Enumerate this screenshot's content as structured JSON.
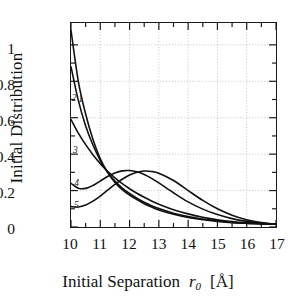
{
  "chart_data": {
    "type": "line",
    "title": "",
    "xlabel": "Initial Separation  r0  [Å]",
    "ylabel": "Initial Distribution",
    "xlim": [
      10,
      17
    ],
    "ylim": [
      0,
      1.12
    ],
    "grid": true,
    "legend": "inline-curve-labels",
    "xticks": [
      10,
      11,
      12,
      13,
      14,
      15,
      16,
      17
    ],
    "xtick_labels": [
      "10",
      "11",
      "12",
      "13",
      "14",
      "15",
      "16",
      "17"
    ],
    "yticks": [
      0,
      0.2,
      0.4,
      0.6,
      0.8,
      1
    ],
    "ytick_labels": [
      "0",
      "0.2",
      "0.4",
      "0.6",
      "0.8",
      "1"
    ],
    "minor_ticks": "half-interval on both axes",
    "x": [
      10.0,
      10.25,
      10.5,
      10.75,
      11.0,
      11.25,
      11.5,
      11.75,
      12.0,
      12.25,
      12.5,
      12.75,
      13.0,
      13.5,
      14.0,
      14.5,
      15.0,
      15.5,
      16.0,
      16.5,
      17.0
    ],
    "series": [
      {
        "name": "1",
        "label": "1",
        "label_x": 10.35,
        "label_y": 0.7,
        "values": [
          1.08,
          0.8,
          0.62,
          0.48,
          0.375,
          0.3,
          0.245,
          0.205,
          0.175,
          0.15,
          0.128,
          0.11,
          0.094,
          0.07,
          0.052,
          0.04,
          0.031,
          0.024,
          0.02,
          0.017,
          0.015
        ]
      },
      {
        "name": "2",
        "label": "2",
        "label_x": 10.13,
        "label_y": 0.705,
        "values": [
          0.88,
          0.695,
          0.555,
          0.45,
          0.365,
          0.3,
          0.252,
          0.214,
          0.184,
          0.158,
          0.136,
          0.117,
          0.101,
          0.076,
          0.057,
          0.044,
          0.034,
          0.026,
          0.021,
          0.018,
          0.015
        ]
      },
      {
        "name": "3",
        "label": "3",
        "label_x": 10.17,
        "label_y": 0.425,
        "values": [
          0.59,
          0.515,
          0.452,
          0.397,
          0.348,
          0.306,
          0.27,
          0.238,
          0.21,
          0.185,
          0.163,
          0.143,
          0.125,
          0.095,
          0.072,
          0.054,
          0.04,
          0.03,
          0.023,
          0.018,
          0.015
        ]
      },
      {
        "name": "4",
        "label": "4",
        "label_x": 10.21,
        "label_y": 0.245,
        "values": [
          0.24,
          0.213,
          0.212,
          0.228,
          0.252,
          0.277,
          0.296,
          0.308,
          0.31,
          0.303,
          0.288,
          0.267,
          0.242,
          0.188,
          0.138,
          0.098,
          0.068,
          0.046,
          0.031,
          0.021,
          0.015
        ]
      },
      {
        "name": "5",
        "label": "5",
        "label_x": 10.2,
        "label_y": 0.125,
        "values": [
          0.112,
          0.11,
          0.121,
          0.142,
          0.17,
          0.202,
          0.234,
          0.262,
          0.285,
          0.3,
          0.307,
          0.305,
          0.295,
          0.255,
          0.2,
          0.146,
          0.1,
          0.065,
          0.04,
          0.024,
          0.015
        ]
      }
    ]
  },
  "axis": {
    "y_title": "Initial Distribution",
    "x_title_a": "Initial Separation",
    "x_title_var": "r",
    "x_title_sub": "0",
    "x_title_unit": "[Å]"
  }
}
